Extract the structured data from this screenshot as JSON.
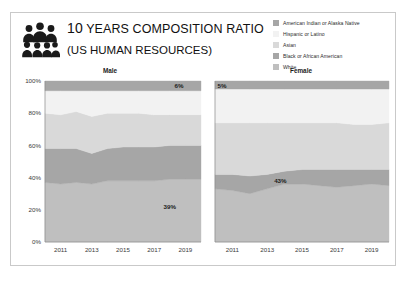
{
  "header": {
    "title_lead": "10",
    "title_rest": " YEARS COMPOSITION RATIO",
    "subtitle": "(US HUMAN RESOURCES)",
    "icon": "group-of-people-icon"
  },
  "legend": {
    "position": "top-right",
    "items": [
      {
        "label": "American Indian or Alaska Native",
        "color": "#a6a6a6"
      },
      {
        "label": "Hispanic or Latino",
        "color": "#f2f2f2"
      },
      {
        "label": "Asian",
        "color": "#d9d9d9"
      },
      {
        "label": "Black or African American",
        "color": "#a6a6a6"
      },
      {
        "label": "White",
        "color": "#bfbfbf"
      }
    ]
  },
  "chart_data": {
    "type": "area",
    "stacked": true,
    "stack_mode": "percent",
    "title": "10 YEARS COMPOSITION RATIO (US HUMAN RESOURCES)",
    "xlabel": "",
    "ylabel": "",
    "ylim": [
      0,
      100
    ],
    "grid": false,
    "ytick_labels": [
      "0%",
      "20%",
      "40%",
      "60%",
      "80%",
      "100%"
    ],
    "ytick_values": [
      0,
      20,
      40,
      60,
      80,
      100
    ],
    "x": [
      2010,
      2011,
      2012,
      2013,
      2014,
      2015,
      2016,
      2017,
      2018,
      2019,
      2020
    ],
    "xtick_labels": [
      "2011",
      "2013",
      "2015",
      "2017",
      "2019"
    ],
    "xtick_values": [
      2011,
      2013,
      2015,
      2017,
      2019
    ],
    "legend_position": "top-right",
    "panels": [
      {
        "name": "Male",
        "title": "Male",
        "series": [
          {
            "name": "White",
            "color": "#bfbfbf",
            "values": [
              37,
              36,
              37,
              36,
              38,
              38,
              38,
              38,
              39,
              39,
              39
            ]
          },
          {
            "name": "Black or African American",
            "color": "#a6a6a6",
            "values": [
              21,
              22,
              21,
              19,
              20,
              21,
              21,
              21,
              21,
              21,
              21
            ]
          },
          {
            "name": "Asian",
            "color": "#d9d9d9",
            "values": [
              22,
              21,
              23,
              23,
              22,
              21,
              21,
              20,
              19,
              19,
              19
            ]
          },
          {
            "name": "Hispanic or Latino",
            "color": "#f2f2f2",
            "values": [
              14,
              15,
              13,
              16,
              14,
              14,
              14,
              15,
              15,
              15,
              15
            ]
          },
          {
            "name": "American Indian or Alaska Native",
            "color": "#a6a6a6",
            "values": [
              6,
              6,
              6,
              6,
              6,
              6,
              6,
              6,
              6,
              6,
              6
            ]
          }
        ],
        "annotations": [
          {
            "text": "6%",
            "x": 2018.3,
            "y": 97,
            "series": "American Indian or Alaska Native"
          },
          {
            "text": "39%",
            "x": 2017.6,
            "y": 22,
            "series": "White"
          }
        ]
      },
      {
        "name": "Female",
        "title": "Female",
        "series": [
          {
            "name": "White",
            "color": "#bfbfbf",
            "values": [
              33,
              32,
              30,
              33,
              36,
              36,
              35,
              34,
              35,
              36,
              35
            ]
          },
          {
            "name": "Black or African American",
            "color": "#a6a6a6",
            "values": [
              9,
              10,
              11,
              9,
              8,
              9,
              10,
              11,
              10,
              9,
              10
            ]
          },
          {
            "name": "Asian",
            "color": "#d9d9d9",
            "values": [
              32,
              32,
              33,
              32,
              30,
              29,
              29,
              29,
              28,
              28,
              29
            ]
          },
          {
            "name": "Hispanic or Latino",
            "color": "#f2f2f2",
            "values": [
              21,
              21,
              21,
              21,
              21,
              21,
              21,
              21,
              22,
              22,
              21
            ]
          },
          {
            "name": "American Indian or Alaska Native",
            "color": "#a6a6a6",
            "values": [
              5,
              5,
              5,
              5,
              5,
              5,
              5,
              5,
              5,
              5,
              5
            ]
          }
        ],
        "annotations": [
          {
            "text": "5%",
            "x": 2010.15,
            "y": 97,
            "series": "American Indian or Alaska Native"
          },
          {
            "text": "43%",
            "x": 2013.4,
            "y": 38,
            "series": "Black or African American"
          }
        ]
      }
    ]
  }
}
